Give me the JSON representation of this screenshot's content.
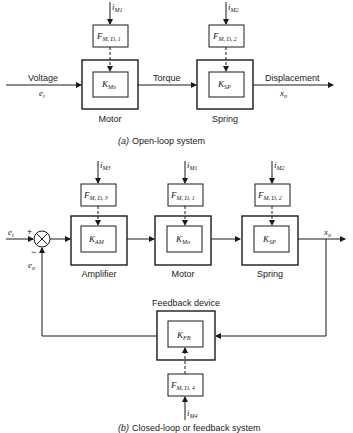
{
  "diagram": {
    "open_loop": {
      "caption_prefix": "(a)",
      "caption": "Open-loop system",
      "input_label": "Voltage",
      "input_symbol": "e",
      "input_sub": "i",
      "mid_label": "Torque",
      "output_label": "Displacement",
      "output_symbol": "x",
      "output_sub": "o",
      "blocks": [
        {
          "name": "Motor",
          "gain": "K",
          "gain_sub": "Mo",
          "disturbance": "F",
          "disturbance_sub": "M, D, 1",
          "input": "i",
          "input_sub": "M1"
        },
        {
          "name": "Spring",
          "gain": "K",
          "gain_sub": "SP",
          "disturbance": "F",
          "disturbance_sub": "M, D, 2",
          "input": "i",
          "input_sub": "M2"
        }
      ]
    },
    "closed_loop": {
      "caption_prefix": "(b)",
      "caption": "Closed-loop or feedback system",
      "input_symbol": "e",
      "input_sub": "i",
      "feedback_symbol": "e",
      "feedback_sub": "o",
      "plus_sign": "+",
      "minus_sign": "−",
      "output_symbol": "x",
      "output_sub": "o",
      "blocks": [
        {
          "name": "Amplifier",
          "gain": "K",
          "gain_sub": "AM",
          "disturbance": "F",
          "disturbance_sub": "M, D, 3",
          "input": "i",
          "input_sub": "M3"
        },
        {
          "name": "Motor",
          "gain": "K",
          "gain_sub": "Mo",
          "disturbance": "F",
          "disturbance_sub": "M, D, 1",
          "input": "i",
          "input_sub": "M1"
        },
        {
          "name": "Spring",
          "gain": "K",
          "gain_sub": "SP",
          "disturbance": "F",
          "disturbance_sub": "M, D, 2",
          "input": "i",
          "input_sub": "M2"
        }
      ],
      "feedback_block": {
        "name": "Feedback device",
        "gain": "K",
        "gain_sub": "FB",
        "disturbance": "F",
        "disturbance_sub": "M, D, 4",
        "input": "i",
        "input_sub": "M4"
      }
    }
  }
}
